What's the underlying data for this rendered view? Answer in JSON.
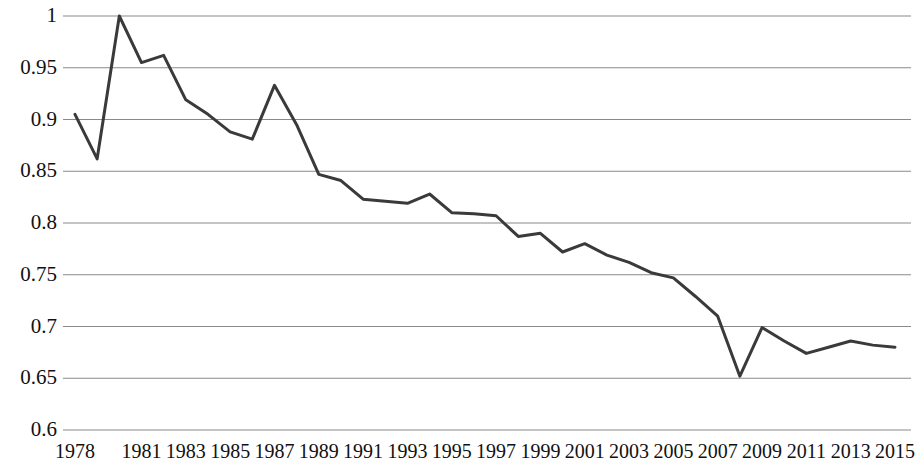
{
  "chart_data": {
    "type": "line",
    "title": "",
    "subtitle": "",
    "xlabel": "",
    "ylabel": "",
    "x": [
      1978,
      1979,
      1980,
      1981,
      1982,
      1983,
      1984,
      1985,
      1986,
      1987,
      1988,
      1989,
      1990,
      1991,
      1992,
      1993,
      1994,
      1995,
      1996,
      1997,
      1998,
      1999,
      2000,
      2001,
      2002,
      2003,
      2004,
      2005,
      2006,
      2007,
      2008,
      2009,
      2010,
      2011,
      2012,
      2013,
      2014,
      2015
    ],
    "values": [
      0.905,
      0.862,
      1.0,
      0.955,
      0.962,
      0.919,
      0.905,
      0.888,
      0.881,
      0.933,
      0.895,
      0.847,
      0.841,
      0.823,
      0.821,
      0.819,
      0.828,
      0.81,
      0.809,
      0.807,
      0.787,
      0.79,
      0.772,
      0.78,
      0.769,
      0.762,
      0.752,
      0.747,
      0.729,
      0.71,
      0.652,
      0.699,
      0.686,
      0.674,
      0.68,
      0.686,
      0.682,
      0.68
    ],
    "series": [
      {
        "name": "series-1",
        "values": [
          0.905,
          0.862,
          1.0,
          0.955,
          0.962,
          0.919,
          0.905,
          0.888,
          0.881,
          0.933,
          0.895,
          0.847,
          0.841,
          0.823,
          0.821,
          0.819,
          0.828,
          0.81,
          0.809,
          0.807,
          0.787,
          0.79,
          0.772,
          0.78,
          0.769,
          0.762,
          0.752,
          0.747,
          0.729,
          0.71,
          0.652,
          0.699,
          0.686,
          0.674,
          0.68,
          0.686,
          0.682,
          0.68
        ],
        "color": "#3a3a3a"
      }
    ],
    "ylim": [
      0.6,
      1.0
    ],
    "xlim": [
      1978,
      2015
    ],
    "yticks": [
      0.6,
      0.65,
      0.7,
      0.75,
      0.8,
      0.85,
      0.9,
      0.95,
      1.0
    ],
    "ytick_labels": [
      "0.6",
      "0.65",
      "0.7",
      "0.75",
      "0.8",
      "0.85",
      "0.9",
      "0.95",
      "1"
    ],
    "xticks": [
      1978,
      1981,
      1983,
      1985,
      1987,
      1989,
      1991,
      1993,
      1995,
      1997,
      1999,
      2001,
      2003,
      2005,
      2007,
      2009,
      2011,
      2013,
      2015
    ],
    "xtick_labels": [
      "1978",
      "1981",
      "1983",
      "1985",
      "1987",
      "1989",
      "1991",
      "1993",
      "1995",
      "1997",
      "1999",
      "2001",
      "2003",
      "2005",
      "2007",
      "2009",
      "2011",
      "2013",
      "2015"
    ],
    "grid": "horizontal",
    "legend": "none",
    "line_color": "#3a3a3a",
    "grid_color": "#8a8a8a",
    "background": "#ffffff",
    "markers": "none",
    "line_width": 3
  }
}
